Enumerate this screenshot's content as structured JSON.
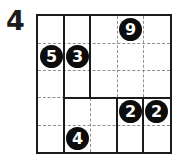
{
  "puzzle": {
    "number": "4",
    "type": "shikaku-grid-solved",
    "grid": {
      "rows": 5,
      "cols": 5
    },
    "clues": [
      {
        "value": "9",
        "row": 0,
        "col": 3
      },
      {
        "value": "5",
        "row": 1,
        "col": 0
      },
      {
        "value": "3",
        "row": 1,
        "col": 1
      },
      {
        "value": "2",
        "row": 3,
        "col": 3
      },
      {
        "value": "2",
        "row": 3,
        "col": 4
      },
      {
        "value": "4",
        "row": 4,
        "col": 1
      }
    ],
    "regions": [
      {
        "clue": "5",
        "top_row": 0,
        "left_col": 0,
        "height": 5,
        "width": 1
      },
      {
        "clue": "3",
        "top_row": 0,
        "left_col": 1,
        "height": 3,
        "width": 1
      },
      {
        "clue": "9",
        "top_row": 0,
        "left_col": 2,
        "height": 3,
        "width": 3
      },
      {
        "clue": "4",
        "top_row": 3,
        "left_col": 1,
        "height": 2,
        "width": 2
      },
      {
        "clue": "2",
        "top_row": 3,
        "left_col": 3,
        "height": 2,
        "width": 1
      },
      {
        "clue": "2",
        "top_row": 3,
        "left_col": 4,
        "height": 2,
        "width": 1
      }
    ],
    "colors": {
      "solid_line": "#1b1b1b",
      "dotted_line": "#8f8f8f",
      "circle_fill": "#0d0d0d",
      "circle_text": "#ffffff",
      "background": "#ffffff"
    }
  }
}
